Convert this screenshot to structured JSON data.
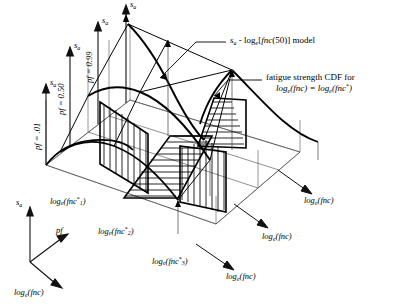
{
  "figure": {
    "kind": "3d-fatigue-strength-surface-diagram"
  },
  "axis_triad": {
    "vertical_label": "s",
    "vertical_sub": "a",
    "diagonal_label": "pf",
    "depth_label": "log",
    "depth_sub": "e",
    "depth_tail": "(fnc)"
  },
  "pf_planes": [
    {
      "id": "pf-001",
      "label": "pf = .01",
      "axis_label": "s",
      "axis_sub": "a"
    },
    {
      "id": "pf-050",
      "label": "pf = 0.50",
      "axis_label": "s",
      "axis_sub": "a"
    },
    {
      "id": "pf-099",
      "label": "pf = 0.99",
      "axis_label": "s",
      "axis_sub": "a"
    },
    {
      "id": "pf-top",
      "label": "",
      "axis_label": "s",
      "axis_sub": "a"
    }
  ],
  "star_labels": [
    {
      "id": "fnc-star-1",
      "head": "log",
      "sub": "e",
      "open": "(fnc",
      "star": "*",
      "index": "1",
      "close": ")"
    },
    {
      "id": "fnc-star-2",
      "head": "log",
      "sub": "e",
      "open": "(fnc",
      "star": "*",
      "index": "2",
      "close": ")"
    },
    {
      "id": "fnc-star-3",
      "head": "log",
      "sub": "e",
      "open": "(fnc",
      "star": "*",
      "index": "3",
      "close": ")"
    }
  ],
  "fnc_axis_labels": [
    {
      "id": "fnc-axis-right-upper",
      "head": "log",
      "sub": "e",
      "tail": "(fnc)"
    },
    {
      "id": "fnc-axis-right-lower",
      "head": "log",
      "sub": "e",
      "tail": "(fnc)"
    },
    {
      "id": "fnc-axis-bottom",
      "head": "log",
      "sub": "e",
      "tail": "(fnc)"
    }
  ],
  "annotations": [
    {
      "id": "model-callout",
      "line1_a": "s",
      "line1_sub": "a",
      "line1_b": " - log",
      "line1_sub2": "e",
      "line1_c": "[",
      "line1_italic": "fnc",
      "line1_d": "(50)]  model"
    },
    {
      "id": "cdf-callout",
      "line1": "fatigue strength CDF for",
      "line2_a": "log",
      "line2_sub_a": "e",
      "line2_b": "(fnc)  = log",
      "line2_sub_b": "e",
      "line2_c": "(fnc",
      "line2_star": "*",
      "line2_d": ")"
    }
  ],
  "colors": {
    "stroke": "#000000",
    "thin": "#3a3a3a",
    "background": "#ffffff"
  }
}
